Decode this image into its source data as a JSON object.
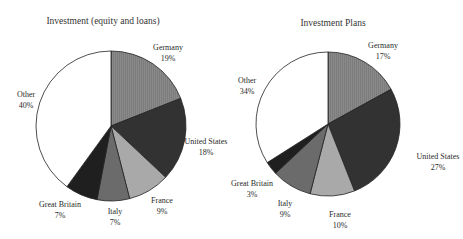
{
  "chart_data": [
    {
      "type": "pie",
      "title": "Investment (equity and loans)",
      "start_angle": "12 o'clock",
      "direction": "clockwise",
      "categories": [
        "Germany",
        "United States",
        "France",
        "Italy",
        "Great Britain",
        "Other"
      ],
      "values": [
        19,
        18,
        9,
        7,
        7,
        40
      ],
      "labels": [
        "19%",
        "18%",
        "9%",
        "7%",
        "7%",
        "40%"
      ],
      "colors": [
        "#7c7c7c",
        "#323232",
        "#a9a9a9",
        "#6b6b6b",
        "#1f1f1f",
        "#ffffff"
      ],
      "legend": "none (direct labels)"
    },
    {
      "type": "pie",
      "title": "Investment Plans",
      "start_angle": "12 o'clock",
      "direction": "clockwise",
      "categories": [
        "Germany",
        "United States",
        "France",
        "Italy",
        "Great Britain",
        "Other"
      ],
      "values": [
        17,
        27,
        10,
        9,
        3,
        34
      ],
      "labels": [
        "17%",
        "27%",
        "10%",
        "9%",
        "3%",
        "34%"
      ],
      "colors": [
        "#7c7c7c",
        "#323232",
        "#a9a9a9",
        "#6b6b6b",
        "#1f1f1f",
        "#ffffff"
      ],
      "legend": "none (direct labels)"
    }
  ],
  "charts": [
    {
      "title": "Investment (equity and loans)",
      "slices": [
        {
          "name": "Germany",
          "pct": "19%"
        },
        {
          "name": "United States",
          "pct": "18%"
        },
        {
          "name": "France",
          "pct": "9%"
        },
        {
          "name": "Italy",
          "pct": "7%"
        },
        {
          "name": "Great Britain",
          "pct": "7%"
        },
        {
          "name": "Other",
          "pct": "40%"
        }
      ]
    },
    {
      "title": "Investment Plans",
      "slices": [
        {
          "name": "Germany",
          "pct": "17%"
        },
        {
          "name": "United States",
          "pct": "27%"
        },
        {
          "name": "France",
          "pct": "10%"
        },
        {
          "name": "Italy",
          "pct": "9%"
        },
        {
          "name": "Great Britain",
          "pct": "3%"
        },
        {
          "name": "Other",
          "pct": "34%"
        }
      ]
    }
  ]
}
